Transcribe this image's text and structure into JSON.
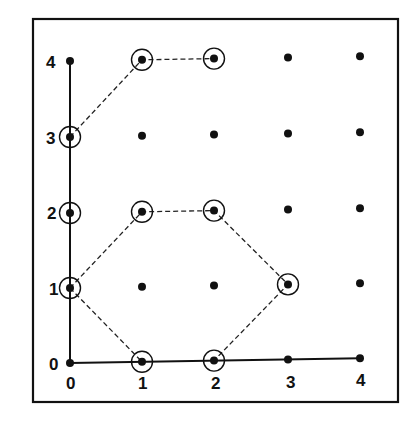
{
  "diagram": {
    "type": "lattice-grid",
    "x_axis_labels": [
      "0",
      "1",
      "2",
      "3",
      "4"
    ],
    "y_axis_labels": [
      "0",
      "1",
      "2",
      "3",
      "4"
    ],
    "grid_points": "all integer points (x,y) with 0<=x<=4, 0<=y<=4",
    "circled_points": [
      [
        1,
        4
      ],
      [
        2,
        4
      ],
      [
        0,
        3
      ],
      [
        0,
        2
      ],
      [
        1,
        2
      ],
      [
        2,
        2
      ],
      [
        0,
        1
      ],
      [
        3,
        1
      ],
      [
        1,
        0
      ],
      [
        2,
        0
      ]
    ],
    "dashed_paths": [
      [
        [
          0,
          3
        ],
        [
          1,
          4
        ],
        [
          2,
          4
        ]
      ],
      [
        [
          0,
          1
        ],
        [
          1,
          2
        ],
        [
          2,
          2
        ],
        [
          3,
          1
        ],
        [
          2,
          0
        ]
      ],
      [
        [
          0,
          1
        ],
        [
          1,
          0
        ]
      ]
    ],
    "axes": "solid lines along x=0 (y 0..4) and y=0 (x 0..4)",
    "colors": {
      "ink": "#111111",
      "background": "#ffffff"
    }
  },
  "labels": {
    "x": [
      "0",
      "1",
      "2",
      "3",
      "4"
    ],
    "y": [
      "0",
      "1",
      "2",
      "3",
      "4"
    ]
  }
}
